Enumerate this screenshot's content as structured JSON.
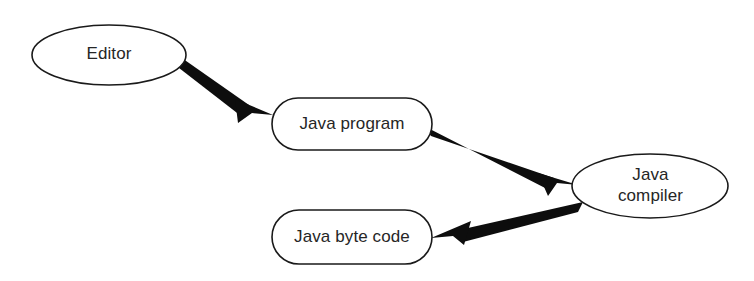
{
  "diagram": {
    "background_color": "#ffffff",
    "stroke_color": "#1a1a1a",
    "arrow_color": "#0d0d0d",
    "text_color": "#262626",
    "nodes": [
      {
        "id": "editor",
        "label": "Editor",
        "shape": "ellipse",
        "cx": 109,
        "cy": 55,
        "rx": 77,
        "ry": 30
      },
      {
        "id": "java-program",
        "label": "Java program",
        "shape": "stadium",
        "x": 272,
        "y": 98,
        "width": 160,
        "height": 52,
        "radius": 26
      },
      {
        "id": "java-compiler",
        "label": "Java\ncompiler",
        "shape": "ellipse",
        "cx": 650,
        "cy": 186,
        "rx": 78,
        "ry": 32
      },
      {
        "id": "java-byte-code",
        "label": "Java byte code",
        "shape": "stadium",
        "x": 272,
        "y": 210,
        "width": 160,
        "height": 54,
        "radius": 27
      }
    ],
    "edges": [
      {
        "id": "editor-to-java-program",
        "from": "editor",
        "to": "java-program",
        "label": "",
        "direction": "forward"
      },
      {
        "id": "java-program-to-java-compiler",
        "from": "java-program",
        "to": "java-compiler",
        "label": "",
        "direction": "forward"
      },
      {
        "id": "java-compiler-to-java-byte-code",
        "from": "java-compiler",
        "to": "java-byte-code",
        "label": "",
        "direction": "forward"
      }
    ]
  }
}
